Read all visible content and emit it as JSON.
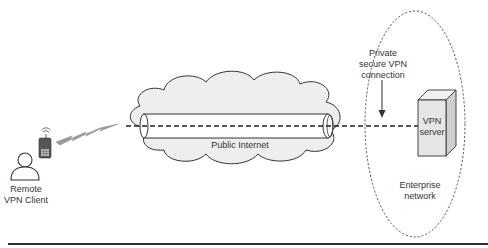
{
  "diagram": {
    "type": "network",
    "nodes": [
      {
        "id": "client",
        "label_lines": [
          "Remote",
          "VPN Client"
        ],
        "kind": "person-with-mobile-phone"
      },
      {
        "id": "internet",
        "label": "Public Internet",
        "kind": "cloud"
      },
      {
        "id": "server",
        "label_lines": [
          "VPN",
          "server"
        ],
        "kind": "server-box"
      },
      {
        "id": "enterprise",
        "label_lines": [
          "Enterprise",
          "network"
        ],
        "kind": "dashed-ellipse"
      }
    ],
    "edges": [
      {
        "from": "client",
        "to": "internet",
        "kind": "wireless-lightning"
      },
      {
        "from": "internet",
        "to": "server",
        "kind": "dashed-tunnel"
      }
    ],
    "annotation": {
      "label_lines": [
        "Private",
        "secure VPN",
        "connection"
      ],
      "points_to": "tunnel"
    }
  },
  "colors": {
    "line": "#333333",
    "cloud_fill": "#eeeeee",
    "server_front": "#e6e6e6",
    "server_side": "#cfcfcf",
    "server_top": "#f2f2f2",
    "lightning": "#9a9a9a",
    "rule": "#2b2b2b"
  }
}
